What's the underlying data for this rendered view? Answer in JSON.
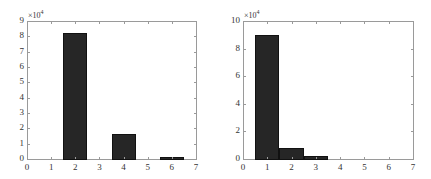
{
  "chart_data": [
    {
      "type": "bar",
      "title": "",
      "xlabel": "",
      "ylabel": "",
      "y_exponent_label": "×10",
      "y_exponent_power": "4",
      "x": [
        2,
        4,
        6
      ],
      "values": [
        82000,
        16000,
        1600
      ],
      "bar_width": 1,
      "xlim": [
        0,
        7
      ],
      "ylim": [
        0,
        90000
      ],
      "xticks": [
        "0",
        "1",
        "2",
        "3",
        "4",
        "5",
        "6",
        "7"
      ],
      "yticks": [
        "0",
        "1",
        "2",
        "3",
        "4",
        "5",
        "6",
        "7",
        "8",
        "9"
      ],
      "grid": false,
      "legend": null,
      "bar_color": "#262626"
    },
    {
      "type": "bar",
      "title": "",
      "xlabel": "",
      "ylabel": "",
      "y_exponent_label": "×10",
      "y_exponent_power": "4",
      "x": [
        1,
        2,
        3
      ],
      "values": [
        90000,
        8000,
        2000
      ],
      "bar_width": 1,
      "xlim": [
        0,
        7
      ],
      "ylim": [
        0,
        100000
      ],
      "xticks": [
        "0",
        "1",
        "2",
        "3",
        "4",
        "5",
        "6",
        "7"
      ],
      "yticks": [
        "0",
        "2",
        "4",
        "6",
        "8",
        "10"
      ],
      "grid": false,
      "legend": null,
      "bar_color": "#262626"
    }
  ],
  "layout": [
    {
      "left": 27,
      "right": 196,
      "top": 21,
      "bottom": 159
    },
    {
      "left": 243,
      "right": 413,
      "top": 21,
      "bottom": 159
    }
  ]
}
